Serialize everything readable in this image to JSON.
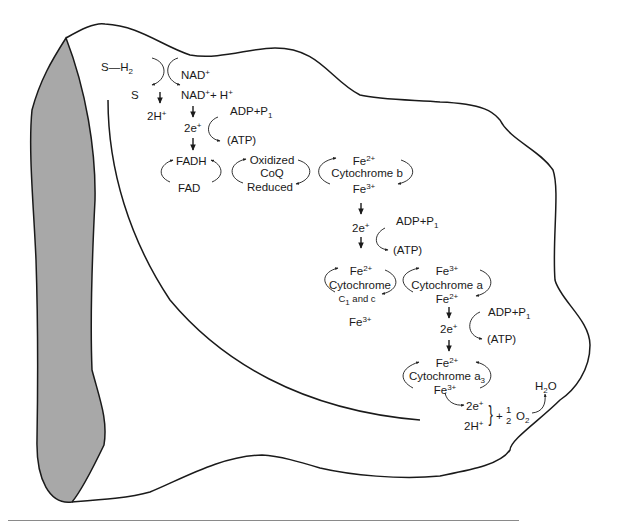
{
  "figure": {
    "type": "diagram",
    "colors": {
      "outline": "#1a1a1a",
      "cut_face": "#a8a8a8",
      "background": "#ffffff",
      "rule": "#8a8a8a"
    }
  },
  "labels": {
    "substrate": "S—H",
    "substrate_sub": "2",
    "s": "S",
    "nad": "NAD",
    "nad_sup": "+",
    "nadh": "NAD",
    "nadh_sup": "+",
    "nadh_rest": "+ H",
    "nadh_rest_sup": "+",
    "two_h": "2H",
    "two_h_sup": "+",
    "e1": "2e",
    "e1_sup": "+",
    "adp1": "ADP+P",
    "adp1_sub": "1",
    "atp1": "(ATP)",
    "fadh": "FADH",
    "fad": "FAD",
    "coq_oxidized": "Oxidized",
    "coq": "CoQ",
    "coq_reduced": "Reduced",
    "cytb_top": "Fe",
    "cytb_top_sup": "2+",
    "cytb": "Cytochrome b",
    "cytb_bot": "Fe",
    "cytb_bot_sup": "3+",
    "e2": "2e",
    "e2_sup": "+",
    "adp2": "ADP+P",
    "adp2_sub": "1",
    "atp2": "(ATP)",
    "cytc_top": "Fe",
    "cytc_top_sup": "2+",
    "cytc": "Cytochrome",
    "cytc_sub_c": "C",
    "cytc_sub_1": "1",
    "cytc_sub_rest": " and c",
    "cytc_bot": "Fe",
    "cytc_bot_sup": "3+",
    "cyta_top": "Fe",
    "cyta_top_sup": "3+",
    "cyta": "Cytochrome a",
    "cyta_bot": "Fe",
    "cyta_bot_sup": "2+",
    "e3": "2e",
    "e3_sup": "+",
    "adp3": "ADP+P",
    "adp3_sub": "1",
    "atp3": "(ATP)",
    "cyta3_top": "Fe",
    "cyta3_top_sup": "2+",
    "cyta3": "Cytochrome a",
    "cyta3_sub": "3",
    "cyta3_bot": "Fe",
    "cyta3_bot_sup": "3+",
    "e4": "2e",
    "e4_sup": "+",
    "h4": "2H",
    "h4_sup": "+",
    "brace": "}",
    "plus": "+",
    "half_num": "1",
    "half_den": "2",
    "o2": "O",
    "o2_sub": "2",
    "water": "H",
    "water_sub": "2",
    "water_o": "O"
  }
}
